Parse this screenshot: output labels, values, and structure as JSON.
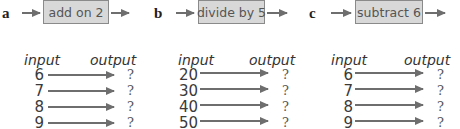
{
  "headers": {
    "input": "input",
    "output": "output"
  },
  "colors": {
    "box_fill": "#d8d8d8",
    "box_border": "#8a8a8a",
    "arrow": "#6e6e6e"
  },
  "panels": [
    {
      "letter": "a",
      "operation": "add on 2",
      "inputs": [
        "6",
        "7",
        "8",
        "9"
      ],
      "outputs": [
        "?",
        "?",
        "?",
        "?"
      ]
    },
    {
      "letter": "b",
      "operation": "divide by 5",
      "inputs": [
        "20",
        "30",
        "40",
        "50"
      ],
      "outputs": [
        "?",
        "?",
        "?",
        "?"
      ]
    },
    {
      "letter": "c",
      "operation": "subtract 6",
      "inputs": [
        "6",
        "7",
        "8",
        "9"
      ],
      "outputs": [
        "?",
        "?",
        "?",
        "?"
      ]
    }
  ]
}
